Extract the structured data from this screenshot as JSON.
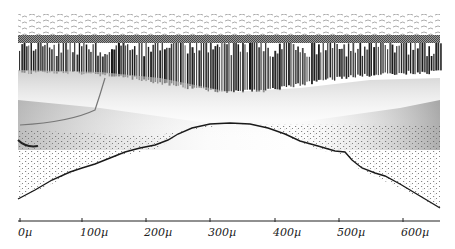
{
  "figure": {
    "layers": [
      {
        "name": "top-cellular-texture"
      },
      {
        "name": "gray-band"
      },
      {
        "name": "columnar-bars"
      },
      {
        "name": "transition-gradient"
      },
      {
        "name": "stippled-region"
      },
      {
        "name": "lower-boundary-curve"
      }
    ],
    "colors": {
      "ink": "#1a1a1a",
      "band": "#6e6e6e",
      "texture": "#8a8a8a",
      "background": "#ffffff"
    }
  },
  "scale_axis": {
    "unit": "µ",
    "ticks": [
      {
        "label": "0µ",
        "x": 20
      },
      {
        "label": "100µ",
        "x": 82
      },
      {
        "label": "200µ",
        "x": 146
      },
      {
        "label": "300µ",
        "x": 210
      },
      {
        "label": "400µ",
        "x": 275
      },
      {
        "label": "500µ",
        "x": 339
      },
      {
        "label": "600µ",
        "x": 403
      }
    ]
  }
}
